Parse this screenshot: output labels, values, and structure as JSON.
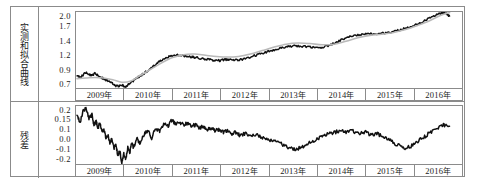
{
  "figure": {
    "panels": [
      {
        "id": "fitted",
        "caption": "实测和拟合曲线",
        "caption_name": "measured-and-fitted-curve"
      },
      {
        "id": "residual",
        "caption": "残差",
        "caption_name": "residual"
      }
    ],
    "x_categories": [
      "2009年",
      "2010年",
      "2011年",
      "2012年",
      "2013年",
      "2014年",
      "2015年",
      "2016年"
    ],
    "colors": {
      "measured": "#111111",
      "fitted": "#b9b9b9",
      "frame": "#8b8b8b",
      "background": "#ffffff"
    }
  },
  "chart_data": [
    {
      "type": "line",
      "id": "fitted-panel",
      "title": "实测和拟合曲线",
      "xlabel": "",
      "ylabel": "实测和拟合曲线",
      "grid": false,
      "legend": "none",
      "xlim": [
        2008.7,
        2016.45
      ],
      "ylim": [
        0.7,
        2.0
      ],
      "ytick_labels": [
        "2.0",
        "1.7",
        "1.4",
        "1.2",
        "0.9",
        "0.7"
      ],
      "ytick_values": [
        2.0,
        1.7,
        1.4,
        1.2,
        0.9,
        0.7
      ],
      "xtick_labels": [
        "2009年",
        "2010年",
        "2011年",
        "2012年",
        "2013年",
        "2014年",
        "2015年",
        "2016年"
      ],
      "xtick_values": [
        2009,
        2010,
        2011,
        2012,
        2013,
        2014,
        2015,
        2016
      ],
      "series": [
        {
          "name": "实测",
          "color": "#111111",
          "x": [
            2008.72,
            2008.78,
            2008.84,
            2008.9,
            2008.96,
            2009.02,
            2009.08,
            2009.14,
            2009.2,
            2009.26,
            2009.32,
            2009.38,
            2009.44,
            2009.5,
            2009.56,
            2009.62,
            2009.68,
            2009.74,
            2009.8,
            2009.86,
            2009.92,
            2009.98,
            2010.06,
            2010.14,
            2010.22,
            2010.3,
            2010.38,
            2010.46,
            2010.54,
            2010.62,
            2010.7,
            2010.78,
            2010.86,
            2010.94,
            2011.02,
            2011.1,
            2011.18,
            2011.26,
            2011.34,
            2011.42,
            2011.5,
            2011.58,
            2011.66,
            2011.74,
            2011.82,
            2011.9,
            2011.98,
            2012.1,
            2012.22,
            2012.34,
            2012.46,
            2012.58,
            2012.7,
            2012.82,
            2012.94,
            2013.06,
            2013.18,
            2013.3,
            2013.42,
            2013.54,
            2013.66,
            2013.78,
            2013.9,
            2014.02,
            2014.14,
            2014.26,
            2014.38,
            2014.5,
            2014.62,
            2014.74,
            2014.86,
            2014.98,
            2015.1,
            2015.22,
            2015.34,
            2015.46,
            2015.58,
            2015.7,
            2015.82,
            2015.94,
            2016.02,
            2016.08,
            2016.14,
            2016.2
          ],
          "y": [
            0.9,
            0.89,
            0.92,
            0.97,
            0.93,
            0.91,
            0.95,
            0.92,
            0.88,
            0.86,
            0.83,
            0.8,
            0.77,
            0.74,
            0.73,
            0.76,
            0.72,
            0.75,
            0.79,
            0.83,
            0.87,
            0.9,
            0.95,
            1.0,
            1.05,
            1.1,
            1.16,
            1.2,
            1.23,
            1.25,
            1.26,
            1.26,
            1.25,
            1.24,
            1.23,
            1.22,
            1.21,
            1.2,
            1.19,
            1.18,
            1.17,
            1.17,
            1.18,
            1.19,
            1.19,
            1.18,
            1.18,
            1.2,
            1.23,
            1.27,
            1.3,
            1.33,
            1.36,
            1.39,
            1.41,
            1.42,
            1.42,
            1.41,
            1.4,
            1.39,
            1.4,
            1.43,
            1.47,
            1.52,
            1.56,
            1.59,
            1.61,
            1.62,
            1.63,
            1.63,
            1.64,
            1.65,
            1.67,
            1.7,
            1.73,
            1.76,
            1.8,
            1.85,
            1.9,
            1.95,
            1.98,
            1.99,
            1.97,
            1.93
          ]
        },
        {
          "name": "拟合",
          "color": "#b9b9b9",
          "x": [
            2008.72,
            2008.9,
            2009.08,
            2009.26,
            2009.44,
            2009.62,
            2009.8,
            2009.98,
            2010.2,
            2010.42,
            2010.64,
            2010.86,
            2011.08,
            2011.3,
            2011.52,
            2011.74,
            2011.96,
            2012.2,
            2012.44,
            2012.68,
            2012.92,
            2013.16,
            2013.4,
            2013.64,
            2013.88,
            2014.12,
            2014.36,
            2014.6,
            2014.84,
            2015.08,
            2015.32,
            2015.56,
            2015.8,
            2016.04,
            2016.2
          ],
          "y": [
            0.86,
            0.87,
            0.88,
            0.87,
            0.84,
            0.8,
            0.82,
            0.91,
            1.02,
            1.13,
            1.22,
            1.27,
            1.28,
            1.26,
            1.24,
            1.23,
            1.24,
            1.28,
            1.34,
            1.4,
            1.45,
            1.47,
            1.46,
            1.44,
            1.45,
            1.5,
            1.56,
            1.6,
            1.62,
            1.65,
            1.7,
            1.77,
            1.85,
            1.95,
            1.99
          ]
        }
      ]
    },
    {
      "type": "line",
      "id": "residual-panel",
      "title": "残差",
      "xlabel": "",
      "ylabel": "残差",
      "grid": false,
      "legend": "none",
      "xlim": [
        2008.7,
        2016.45
      ],
      "ylim": [
        -0.2,
        0.2
      ],
      "ytick_labels": [
        "0.2",
        "0.15",
        "0.1",
        "0.0",
        "-0.1",
        "-0.2"
      ],
      "ytick_values": [
        0.2,
        0.15,
        0.1,
        0.0,
        -0.1,
        -0.2
      ],
      "xtick_labels": [
        "2009年",
        "2010年",
        "2011年",
        "2012年",
        "2013年",
        "2014年",
        "2015年",
        "2016年"
      ],
      "xtick_values": [
        2009,
        2010,
        2011,
        2012,
        2013,
        2014,
        2015,
        2016
      ],
      "series": [
        {
          "name": "残差",
          "color": "#111111",
          "x": [
            2008.72,
            2008.78,
            2008.84,
            2008.9,
            2008.96,
            2009.02,
            2009.06,
            2009.1,
            2009.14,
            2009.18,
            2009.22,
            2009.26,
            2009.3,
            2009.34,
            2009.38,
            2009.42,
            2009.46,
            2009.5,
            2009.54,
            2009.58,
            2009.62,
            2009.66,
            2009.7,
            2009.74,
            2009.78,
            2009.82,
            2009.86,
            2009.92,
            2009.98,
            2010.06,
            2010.14,
            2010.22,
            2010.3,
            2010.38,
            2010.46,
            2010.54,
            2010.62,
            2010.7,
            2010.78,
            2010.86,
            2010.94,
            2011.02,
            2011.1,
            2011.18,
            2011.26,
            2011.34,
            2011.42,
            2011.5,
            2011.58,
            2011.66,
            2011.74,
            2011.82,
            2011.9,
            2011.98,
            2012.1,
            2012.22,
            2012.34,
            2012.46,
            2012.58,
            2012.7,
            2012.82,
            2012.94,
            2013.06,
            2013.18,
            2013.3,
            2013.42,
            2013.54,
            2013.66,
            2013.78,
            2013.9,
            2014.02,
            2014.14,
            2014.26,
            2014.38,
            2014.5,
            2014.62,
            2014.74,
            2014.86,
            2014.98,
            2015.1,
            2015.22,
            2015.34,
            2015.46,
            2015.58,
            2015.7,
            2015.82,
            2015.94,
            2016.02,
            2016.1,
            2016.2
          ],
          "y": [
            0.13,
            0.09,
            0.16,
            0.19,
            0.11,
            0.14,
            0.07,
            0.1,
            0.05,
            0.08,
            0.02,
            0.04,
            -0.02,
            0.0,
            -0.05,
            -0.03,
            -0.09,
            -0.07,
            -0.14,
            -0.11,
            -0.19,
            -0.13,
            -0.17,
            -0.08,
            -0.12,
            -0.05,
            -0.09,
            -0.02,
            -0.06,
            0.0,
            0.03,
            -0.02,
            0.05,
            0.02,
            0.08,
            0.06,
            0.1,
            0.08,
            0.09,
            0.07,
            0.08,
            0.06,
            0.07,
            0.05,
            0.06,
            0.04,
            0.05,
            0.03,
            0.04,
            0.02,
            0.03,
            0.01,
            0.02,
            0.0,
            0.01,
            -0.01,
            0.0,
            -0.02,
            -0.04,
            -0.03,
            -0.06,
            -0.08,
            -0.1,
            -0.09,
            -0.07,
            -0.05,
            -0.03,
            -0.01,
            0.01,
            0.02,
            0.03,
            0.02,
            0.03,
            0.01,
            0.02,
            0.0,
            0.01,
            -0.01,
            -0.03,
            -0.06,
            -0.08,
            -0.09,
            -0.07,
            -0.04,
            -0.01,
            0.02,
            0.04,
            0.06,
            0.07,
            0.06
          ]
        }
      ]
    }
  ]
}
